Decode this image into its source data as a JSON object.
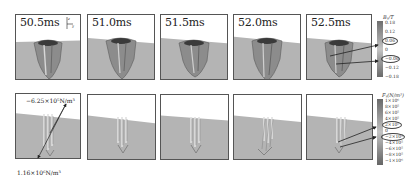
{
  "figure": {
    "top_row": {
      "quantity": "magnetic flux density B_y",
      "panels": [
        {
          "time": "50.5ms"
        },
        {
          "time": "51.0ms"
        },
        {
          "time": "51.5ms"
        },
        {
          "time": "52.0ms"
        },
        {
          "time": "52.5ms"
        }
      ],
      "axes_glyph": {
        "z": "z",
        "y": "y"
      },
      "legend": {
        "title": "Bᵧ/T",
        "ticks": [
          "0.18",
          "0.12",
          "0.06",
          "0",
          "−0.06",
          "−0.12",
          "−0.18"
        ],
        "circled": [
          "0.06",
          "−0.06"
        ],
        "colors": [
          "#6e6e6e",
          "#8a8a8a",
          "#a4a4a4",
          "#bdbdbd",
          "#a0a0a0",
          "#888888",
          "#6a6a6a"
        ]
      }
    },
    "bottom_row": {
      "quantity": "electromagnetic force F_y",
      "panels": [
        {
          "time": ""
        },
        {
          "time": ""
        },
        {
          "time": ""
        },
        {
          "time": ""
        },
        {
          "time": ""
        }
      ],
      "annotations": {
        "upper": "−6.25×10⁵N/m³",
        "lower": "1.16×10⁶N/m³"
      },
      "legend": {
        "title": "Fᵧ(N/m³)",
        "ticks": [
          "1×10⁶",
          "8×10⁵",
          "6×10⁵",
          "4×10⁵",
          "2×10⁵",
          "0",
          "−2×10⁵",
          "−4×10⁵",
          "−6×10⁵",
          "−8×10⁵",
          "−1×10⁶"
        ],
        "circled": [
          "2×10⁵",
          "−2×10⁵"
        ],
        "colors": [
          "#6a6a6a",
          "#7a7a7a",
          "#8c8c8c",
          "#9e9e9e",
          "#b0b0b0",
          "#c2c2c2",
          "#b0b0b0",
          "#9c9c9c",
          "#888888",
          "#767676",
          "#666666"
        ]
      }
    }
  }
}
